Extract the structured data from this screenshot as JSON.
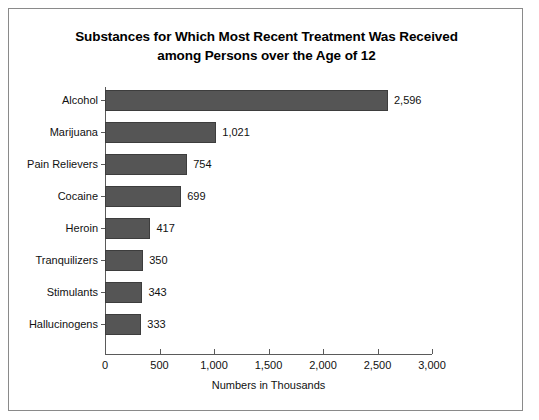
{
  "chart_data": {
    "type": "bar",
    "orientation": "horizontal",
    "title": "Substances for Which Most Recent Treatment Was Received among Persons over the Age of 12",
    "title_lines": [
      "Substances for Which Most Recent Treatment Was Received",
      "among Persons over the Age of 12"
    ],
    "categories": [
      "Alcohol",
      "Marijuana",
      "Pain Relievers",
      "Cocaine",
      "Heroin",
      "Tranquilizers",
      "Stimulants",
      "Hallucinogens"
    ],
    "values": [
      2596,
      1021,
      754,
      699,
      417,
      350,
      343,
      333
    ],
    "value_labels": [
      "2,596",
      "1,021",
      "754",
      "699",
      "417",
      "350",
      "343",
      "333"
    ],
    "xlabel": "Numbers in Thousands",
    "ylabel": "",
    "xlim": [
      0,
      3000
    ],
    "xticks": [
      0,
      500,
      1000,
      1500,
      2000,
      2500,
      3000
    ],
    "xtick_labels": [
      "0",
      "500",
      "1,000",
      "1,500",
      "2,000",
      "2,500",
      "3,000"
    ],
    "grid": false,
    "legend": null,
    "bar_color": "#555555",
    "bar_edge_color": "#3d3d3d",
    "axis_color": "#5a5a5a",
    "text_color": "#111111",
    "background_color": "#ffffff",
    "border_color": "#8a8a8a"
  }
}
